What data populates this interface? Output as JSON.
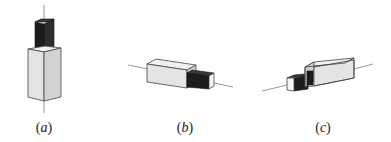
{
  "figure": {
    "panels": [
      {
        "id": "a",
        "label_open": "(",
        "label_letter": "a",
        "label_close": ")",
        "orientation": "vertical",
        "small_block_position": "top"
      },
      {
        "id": "b",
        "label_open": "(",
        "label_letter": "b",
        "label_close": ")",
        "orientation": "horizontal",
        "small_block_position": "right"
      },
      {
        "id": "c",
        "label_open": "(",
        "label_letter": "c",
        "label_close": ")",
        "orientation": "horizontal",
        "small_block_position": "left"
      }
    ],
    "colors": {
      "large_block_front": "#e4e4e4",
      "large_block_side": "#d2d2d2",
      "large_block_top": "#f0f0f0",
      "small_block_dark": "#1c1c1c",
      "small_block_dark_side": "#2e2e2e",
      "small_block_end": "#f6f6f6",
      "axis_line": "#8a8a8a",
      "edge": "#444444"
    }
  }
}
